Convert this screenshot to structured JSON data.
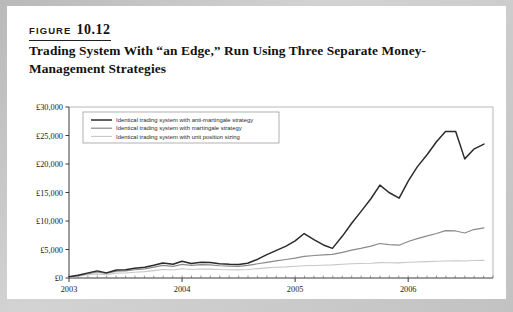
{
  "figure": {
    "label_word": "FIGURE",
    "label_number": "10.12",
    "title": "Trading System With “an Edge,” Run Using Three Separate Money-Management Strategies"
  },
  "chart_data": {
    "type": "line",
    "title": "",
    "xlabel": "",
    "ylabel": "",
    "ylim": [
      0,
      30000
    ],
    "yticks": [
      0,
      5000,
      10000,
      15000,
      20000,
      25000,
      30000
    ],
    "ytick_labels": [
      "£0",
      "£5,000",
      "£10,000",
      "£15,000",
      "£20,000",
      "£25,000",
      "£30,000"
    ],
    "xlim": [
      2003.0,
      2006.75
    ],
    "xticks": [
      2003,
      2004,
      2005,
      2006
    ],
    "xtick_labels": [
      "2003",
      "2004",
      "2005",
      "2006"
    ],
    "grid": false,
    "legend_position": "upper-left",
    "currency": "£",
    "x": [
      2003.0,
      2003.08,
      2003.17,
      2003.25,
      2003.33,
      2003.42,
      2003.5,
      2003.58,
      2003.67,
      2003.75,
      2003.83,
      2003.92,
      2004.0,
      2004.08,
      2004.17,
      2004.25,
      2004.33,
      2004.42,
      2004.5,
      2004.58,
      2004.67,
      2004.75,
      2004.83,
      2004.92,
      2005.0,
      2005.08,
      2005.17,
      2005.25,
      2005.33,
      2005.42,
      2005.5,
      2005.58,
      2005.67,
      2005.75,
      2005.83,
      2005.92,
      2006.0,
      2006.08,
      2006.17,
      2006.25,
      2006.33,
      2006.42,
      2006.5,
      2006.58,
      2006.67
    ],
    "series": [
      {
        "name": "Identical trading system with anti-martingale strategy",
        "color": "#2b2b2b",
        "width": 1.5,
        "values": [
          200,
          500,
          900,
          1250,
          900,
          1400,
          1450,
          1700,
          1900,
          2250,
          2650,
          2400,
          2950,
          2550,
          2750,
          2700,
          2500,
          2400,
          2350,
          2600,
          3300,
          4100,
          4800,
          5600,
          6500,
          7800,
          6700,
          5800,
          5200,
          7400,
          9600,
          11600,
          13900,
          16300,
          15000,
          14000,
          17000,
          19500,
          21700,
          23900,
          25700,
          25700,
          20900,
          22600,
          23500
        ]
      },
      {
        "name": "Identical trading system with martingale strategy",
        "color": "#8a8a8a",
        "width": 1.2,
        "values": [
          180,
          430,
          780,
          1050,
          800,
          1200,
          1250,
          1450,
          1600,
          1900,
          2200,
          2050,
          2400,
          2200,
          2350,
          2300,
          2150,
          2100,
          2050,
          2200,
          2500,
          2750,
          3000,
          3250,
          3500,
          3800,
          3950,
          4050,
          4150,
          4500,
          4900,
          5200,
          5600,
          6050,
          5850,
          5750,
          6400,
          6900,
          7400,
          7800,
          8300,
          8250,
          7900,
          8500,
          8800
        ]
      },
      {
        "name": "Identical trading system with unit position sizing",
        "color": "#c7c7c7",
        "width": 1.1,
        "values": [
          120,
          300,
          560,
          720,
          560,
          850,
          880,
          1000,
          1120,
          1300,
          1500,
          1400,
          1620,
          1500,
          1580,
          1560,
          1480,
          1450,
          1420,
          1500,
          1650,
          1780,
          1880,
          1950,
          2050,
          2150,
          2200,
          2250,
          2300,
          2400,
          2500,
          2550,
          2600,
          2700,
          2680,
          2650,
          2750,
          2820,
          2880,
          2930,
          2990,
          3000,
          2980,
          3060,
          3100
        ]
      }
    ]
  }
}
